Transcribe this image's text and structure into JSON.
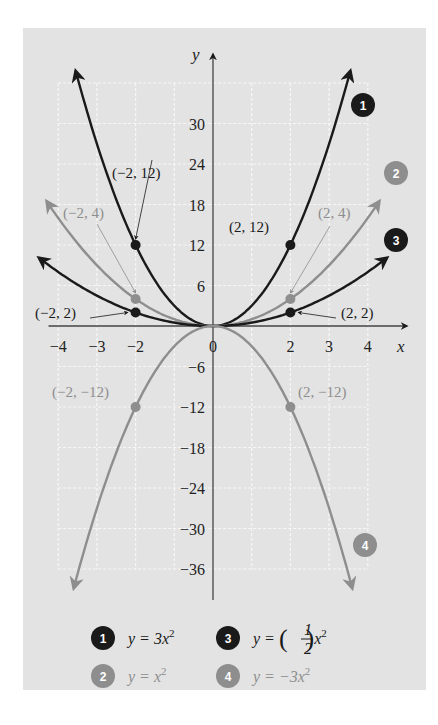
{
  "chart_data": {
    "type": "line",
    "title": "",
    "xlabel": "x",
    "ylabel": "y",
    "xlim": [
      -4,
      4
    ],
    "ylim": [
      -36,
      36
    ],
    "grid": true,
    "x_ticks": [
      -4,
      -3,
      -2,
      0,
      2,
      3,
      4
    ],
    "x_tick_labels": [
      "−4",
      "−3",
      "−2",
      "0",
      "2",
      "3",
      "4"
    ],
    "y_ticks": [
      30,
      24,
      18,
      12,
      6,
      -6,
      -12,
      -18,
      -24,
      -30,
      -36
    ],
    "y_tick_labels": [
      "30",
      "24",
      "18",
      "12",
      "6",
      "−6",
      "−12",
      "−18",
      "−24",
      "−30",
      "−36"
    ],
    "colors": {
      "dark": "#1a1a1a",
      "gray": "#8e8e8e",
      "background": "#e3e3e3",
      "grid": "#f7f7f7"
    },
    "series": [
      {
        "id": 1,
        "name": "y = 3x²",
        "a": 3,
        "color": "#1a1a1a",
        "x_range": [
          -3.55,
          3.55
        ]
      },
      {
        "id": 2,
        "name": "y = x²",
        "a": 1,
        "color": "#8e8e8e",
        "x_range": [
          -4.3,
          4.3
        ]
      },
      {
        "id": 3,
        "name": "y = (1/2)x²",
        "a": 0.5,
        "color": "#1a1a1a",
        "x_range": [
          -4.5,
          4.5
        ]
      },
      {
        "id": 4,
        "name": "y = −3x²",
        "a": -3,
        "color": "#8e8e8e",
        "x_range": [
          -3.6,
          3.6
        ]
      }
    ],
    "points": [
      {
        "x": -2,
        "y": 12,
        "label": "(−2, 12)",
        "series": 1
      },
      {
        "x": 2,
        "y": 12,
        "label": "(2, 12)",
        "series": 1
      },
      {
        "x": -2,
        "y": 4,
        "label": "(−2, 4)",
        "series": 2
      },
      {
        "x": 2,
        "y": 4,
        "label": "(2, 4)",
        "series": 2
      },
      {
        "x": -2,
        "y": 2,
        "label": "(−2, 2)",
        "series": 3
      },
      {
        "x": 2,
        "y": 2,
        "label": "(2, 2)",
        "series": 3
      },
      {
        "x": -2,
        "y": -12,
        "label": "(−2, −12)",
        "series": 4
      },
      {
        "x": 2,
        "y": -12,
        "label": "(2, −12)",
        "series": 4
      }
    ],
    "legend": {
      "placement": "bottom",
      "entries": [
        {
          "badge": "1",
          "lhs": "y = 3x",
          "sup": "2",
          "color": "#1a1a1a"
        },
        {
          "badge": "3",
          "lhs": "y = ",
          "frac_num": "1",
          "frac_den": "2",
          "rhs": "x",
          "sup": "2",
          "color": "#1a1a1a"
        },
        {
          "badge": "2",
          "lhs": "y = x",
          "sup": "2",
          "color": "#8e8e8e"
        },
        {
          "badge": "4",
          "lhs": "y = −3x",
          "sup": "2",
          "color": "#8e8e8e"
        }
      ]
    }
  }
}
